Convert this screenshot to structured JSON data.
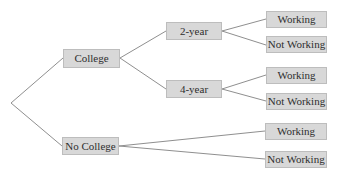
{
  "diagram": {
    "type": "tree",
    "orientation": "left-to-right",
    "colors": {
      "box_fill": "#d8d8d8",
      "box_border": "#bdbdbd",
      "edge": "#8f8f8f",
      "text": "#2e2e2e"
    },
    "root": {
      "x": 11,
      "y": 103
    },
    "nodes": {
      "college": {
        "label": "College",
        "x": 63,
        "y": 49,
        "w": 57,
        "h": 19
      },
      "no_college": {
        "label": "No College",
        "x": 62,
        "y": 137,
        "w": 57,
        "h": 18
      },
      "two_year": {
        "label": "2-year",
        "x": 166,
        "y": 22,
        "w": 56,
        "h": 18
      },
      "four_year": {
        "label": "4-year",
        "x": 166,
        "y": 80,
        "w": 56,
        "h": 18
      },
      "w1": {
        "label": "Working",
        "x": 266,
        "y": 11,
        "w": 61,
        "h": 17
      },
      "nw1": {
        "label": "Not Working",
        "x": 266,
        "y": 36,
        "w": 61,
        "h": 17
      },
      "w2": {
        "label": "Working",
        "x": 266,
        "y": 67,
        "w": 61,
        "h": 17
      },
      "nw2": {
        "label": "Not Working",
        "x": 266,
        "y": 93,
        "w": 61,
        "h": 17
      },
      "w3": {
        "label": "Working",
        "x": 265,
        "y": 123,
        "w": 62,
        "h": 17
      },
      "nw3": {
        "label": "Not Working",
        "x": 265,
        "y": 151,
        "w": 62,
        "h": 17
      }
    },
    "edges": [
      [
        "root",
        "college"
      ],
      [
        "root",
        "no_college"
      ],
      [
        "college",
        "two_year"
      ],
      [
        "college",
        "four_year"
      ],
      [
        "two_year",
        "w1"
      ],
      [
        "two_year",
        "nw1"
      ],
      [
        "four_year",
        "w2"
      ],
      [
        "four_year",
        "nw2"
      ],
      [
        "no_college",
        "w3"
      ],
      [
        "no_college",
        "nw3"
      ]
    ]
  }
}
